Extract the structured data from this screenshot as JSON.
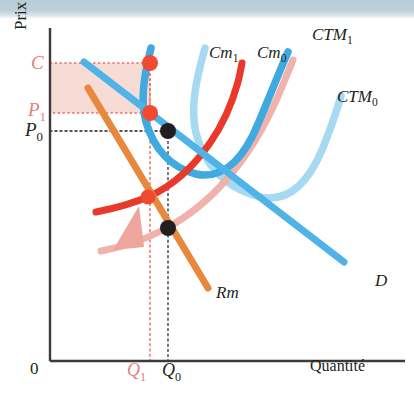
{
  "figure": {
    "type": "economics-diagram",
    "axes": {
      "y_axis_label": "Prix",
      "x_axis_label": "Quantité",
      "origin_label": "0"
    },
    "y_ticks": [
      {
        "label": "C",
        "sub": "",
        "color": "#e2827a",
        "y": 63
      },
      {
        "label": "P",
        "sub": "1",
        "color": "#e2827a",
        "y": 113
      },
      {
        "label": "P",
        "sub": "0",
        "color": "#231f20",
        "y": 131
      }
    ],
    "x_ticks": [
      {
        "label": "Q",
        "sub": "1",
        "color": "#e2827a",
        "x": 150
      },
      {
        "label": "Q",
        "sub": "0",
        "color": "#231f20",
        "x": 168
      }
    ],
    "curves": [
      {
        "name": "CTM",
        "sub": "1",
        "color": "#3fa9e0",
        "label_x": 312,
        "label_y": 26,
        "role": "average-total-cost-after"
      },
      {
        "name": "CTM",
        "sub": "0",
        "color": "#a6d9f2",
        "label_x": 337,
        "label_y": 88,
        "role": "average-total-cost-before"
      },
      {
        "name": "Cm",
        "sub": "1",
        "color": "#e8392a",
        "label_x": 209,
        "label_y": 52,
        "role": "marginal-cost-after"
      },
      {
        "name": "Cm",
        "sub": "0",
        "color": "#f0b3ac",
        "label_x": 257,
        "label_y": 52,
        "role": "marginal-cost-before"
      },
      {
        "name": "D",
        "sub": "",
        "color": "#4fb3e8",
        "label_x": 375,
        "label_y": 281,
        "role": "demand"
      },
      {
        "name": "Rm",
        "sub": "",
        "color": "#e8883c",
        "label_x": 218,
        "label_y": 293,
        "role": "marginal-revenue"
      }
    ],
    "points": [
      {
        "name": "point-C",
        "x": 150,
        "y": 63,
        "color": "#f04a32",
        "kind": "red"
      },
      {
        "name": "point-P1",
        "x": 150,
        "y": 113,
        "color": "#f04a32",
        "kind": "red"
      },
      {
        "name": "point-P0",
        "x": 168,
        "y": 131,
        "color": "#231f20",
        "kind": "black"
      },
      {
        "name": "point-Cm1-Rm",
        "x": 148,
        "y": 197,
        "color": "#f04a32",
        "kind": "red"
      },
      {
        "name": "point-Cm0-Rm",
        "x": 168,
        "y": 228,
        "color": "#231f20",
        "kind": "black"
      }
    ],
    "shaded_area": {
      "name": "profit-rectangle",
      "x": 50,
      "y": 63,
      "width": 100,
      "height": 50,
      "fill": "#f6d8d0",
      "border": "#e8695a"
    },
    "shift_arrow": {
      "name": "cost-shift-arrow",
      "color": "#efa49c",
      "direction": "up-left"
    },
    "colors": {
      "bright_blue": "#4fb3e8",
      "pale_blue": "#a6d9f2",
      "red": "#e8392a",
      "pale_red": "#f0b3ac",
      "orange": "#e8883c",
      "salmon": "#e2827a",
      "black": "#231f20",
      "scan_band": "#b8cdd8"
    }
  }
}
